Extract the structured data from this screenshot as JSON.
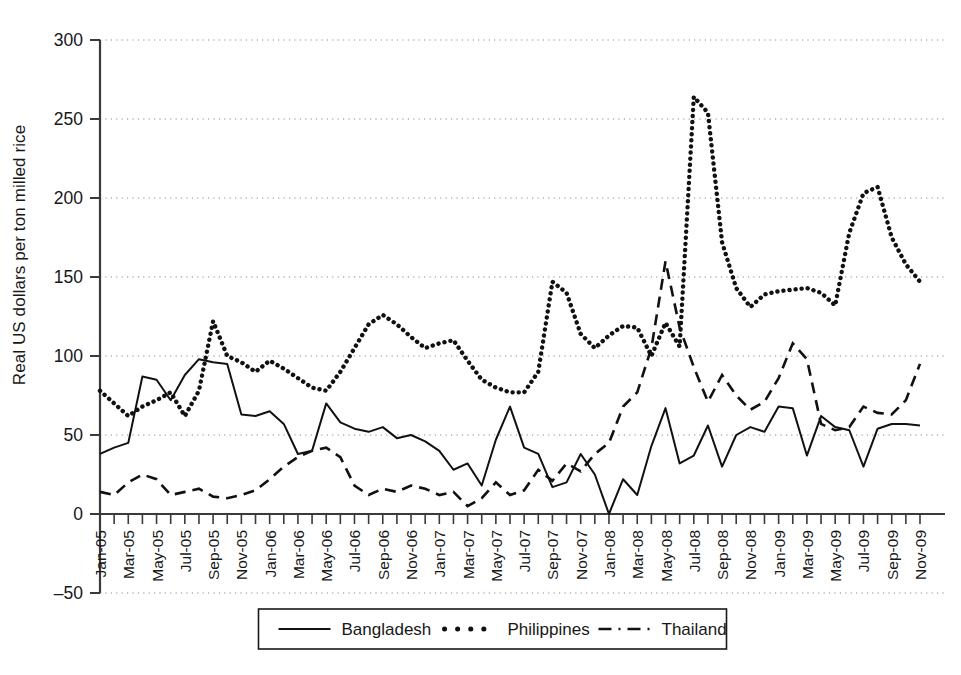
{
  "chart_data": {
    "type": "line",
    "title": "",
    "xlabel": "",
    "ylabel": "Real US dollars per ton milled rice",
    "ylim": [
      -50,
      300
    ],
    "yticks": [
      -50,
      0,
      50,
      100,
      150,
      200,
      250,
      300
    ],
    "grid": "horizontal-dotted",
    "legend_position": "bottom-center",
    "x_tick_step_months": 2,
    "x_first": "Jan-05",
    "x_last": "Nov-09",
    "x": [
      "Jan-05",
      "Feb-05",
      "Mar-05",
      "Apr-05",
      "May-05",
      "Jun-05",
      "Jul-05",
      "Aug-05",
      "Sep-05",
      "Oct-05",
      "Nov-05",
      "Dec-05",
      "Jan-06",
      "Feb-06",
      "Mar-06",
      "Apr-06",
      "May-06",
      "Jun-06",
      "Jul-06",
      "Aug-06",
      "Sep-06",
      "Oct-06",
      "Nov-06",
      "Dec-06",
      "Jan-07",
      "Feb-07",
      "Mar-07",
      "Apr-07",
      "May-07",
      "Jun-07",
      "Jul-07",
      "Aug-07",
      "Sep-07",
      "Oct-07",
      "Nov-07",
      "Dec-07",
      "Jan-08",
      "Feb-08",
      "Mar-08",
      "Apr-08",
      "May-08",
      "Jun-08",
      "Jul-08",
      "Aug-08",
      "Sep-08",
      "Oct-08",
      "Nov-08",
      "Dec-08",
      "Jan-09",
      "Feb-09",
      "Mar-09",
      "Apr-09",
      "May-09",
      "Jun-09",
      "Jul-09",
      "Aug-09",
      "Sep-09",
      "Oct-09",
      "Nov-09"
    ],
    "xticklabels": [
      "Jan-05",
      "Mar-05",
      "May-05",
      "Jul-05",
      "Sep-05",
      "Nov-05",
      "Jan-06",
      "Mar-06",
      "May-06",
      "Jul-06",
      "Sep-06",
      "Nov-06",
      "Jan-07",
      "Mar-07",
      "May-07",
      "Jul-07",
      "Sep-07",
      "Nov-07",
      "Jan-08",
      "Mar-08",
      "May-08",
      "Jul-08",
      "Sep-08",
      "Nov-08",
      "Jan-09",
      "Mar-09",
      "May-09",
      "Jul-09",
      "Sep-09",
      "Nov-09"
    ],
    "series": [
      {
        "name": "Bangladesh",
        "style": "solid",
        "color": "#111111",
        "values": [
          38,
          42,
          45,
          87,
          85,
          72,
          88,
          98,
          96,
          95,
          63,
          62,
          65,
          57,
          38,
          40,
          70,
          58,
          54,
          52,
          55,
          48,
          50,
          46,
          40,
          28,
          32,
          18,
          47,
          68,
          42,
          38,
          17,
          20,
          38,
          25,
          0,
          22,
          12,
          43,
          67,
          32,
          37,
          56,
          30,
          50,
          55,
          52,
          68,
          67,
          37,
          62,
          55,
          53,
          30,
          54,
          57,
          57,
          56
        ]
      },
      {
        "name": "Philippines",
        "style": "dotted",
        "color": "#111111",
        "values": [
          78,
          70,
          62,
          68,
          72,
          77,
          62,
          78,
          122,
          100,
          96,
          90,
          97,
          92,
          86,
          80,
          78,
          90,
          105,
          120,
          126,
          120,
          112,
          105,
          108,
          110,
          97,
          85,
          80,
          77,
          77,
          90,
          147,
          140,
          114,
          105,
          113,
          119,
          118,
          100,
          121,
          106,
          264,
          254,
          172,
          143,
          131,
          139,
          141,
          142,
          143,
          140,
          132,
          178,
          203,
          207,
          175,
          158,
          147
        ]
      },
      {
        "name": "Thailand",
        "style": "dashed",
        "color": "#111111",
        "values": [
          14,
          12,
          20,
          25,
          22,
          12,
          14,
          16,
          11,
          10,
          12,
          15,
          22,
          30,
          36,
          40,
          42,
          36,
          18,
          12,
          16,
          14,
          18,
          16,
          12,
          14,
          5,
          10,
          20,
          12,
          15,
          28,
          21,
          32,
          27,
          38,
          45,
          68,
          77,
          105,
          160,
          118,
          93,
          71,
          88,
          75,
          66,
          71,
          86,
          108,
          98,
          57,
          53,
          55,
          68,
          64,
          63,
          72,
          95
        ]
      }
    ]
  },
  "legend": {
    "items": [
      {
        "label": "Bangladesh",
        "style": "solid"
      },
      {
        "label": "Philippines",
        "style": "dotted"
      },
      {
        "label": "Thailand",
        "style": "dashed"
      }
    ]
  }
}
